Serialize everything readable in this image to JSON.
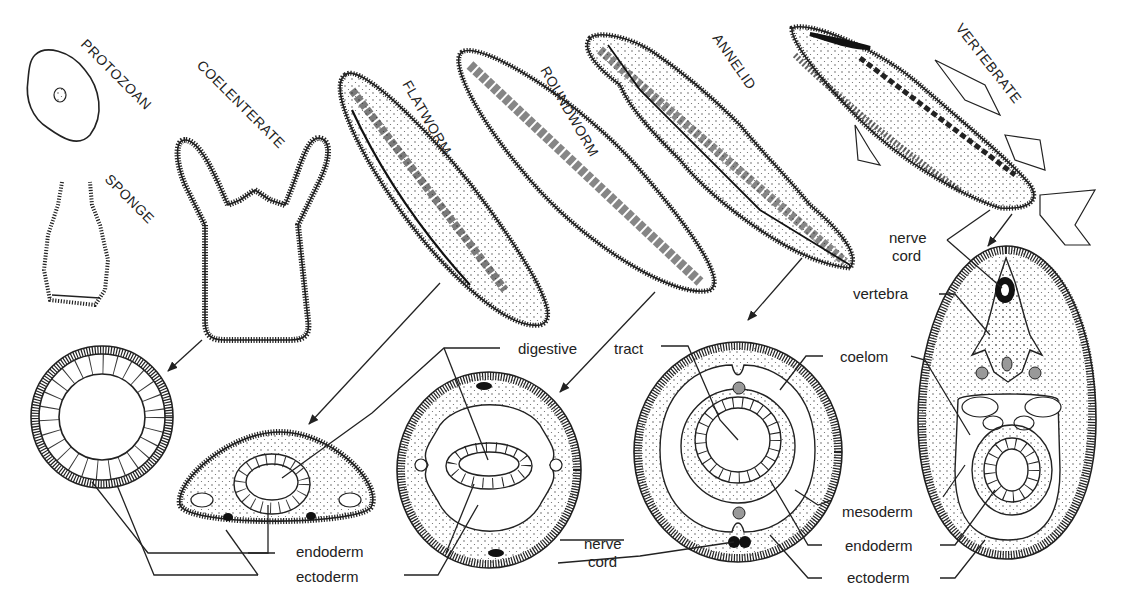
{
  "figure": {
    "organisms": [
      {
        "id": "protozoan",
        "label": "PROTOZOAN"
      },
      {
        "id": "sponge",
        "label": "SPONGE"
      },
      {
        "id": "coelenterate",
        "label": "COELENTERATE"
      },
      {
        "id": "flatworm",
        "label": "FLATWORM"
      },
      {
        "id": "roundworm",
        "label": "ROUNDWORM"
      },
      {
        "id": "annelid",
        "label": "ANNELID"
      },
      {
        "id": "vertebrate",
        "label": "VERTEBRATE"
      }
    ],
    "labels": {
      "digestive": "digestive",
      "tract": "tract",
      "coelom": "coelom",
      "mesoderm": "mesoderm",
      "endoderm_left": "endoderm",
      "ectoderm_left": "ectoderm",
      "endoderm_right": "endoderm",
      "ectoderm_right": "ectoderm",
      "nerve_cord_mid_1": "nerve",
      "nerve_cord_mid_2": "cord",
      "nerve_cord_top_1": "nerve",
      "nerve_cord_top_2": "cord",
      "vertebra": "vertebra"
    }
  }
}
